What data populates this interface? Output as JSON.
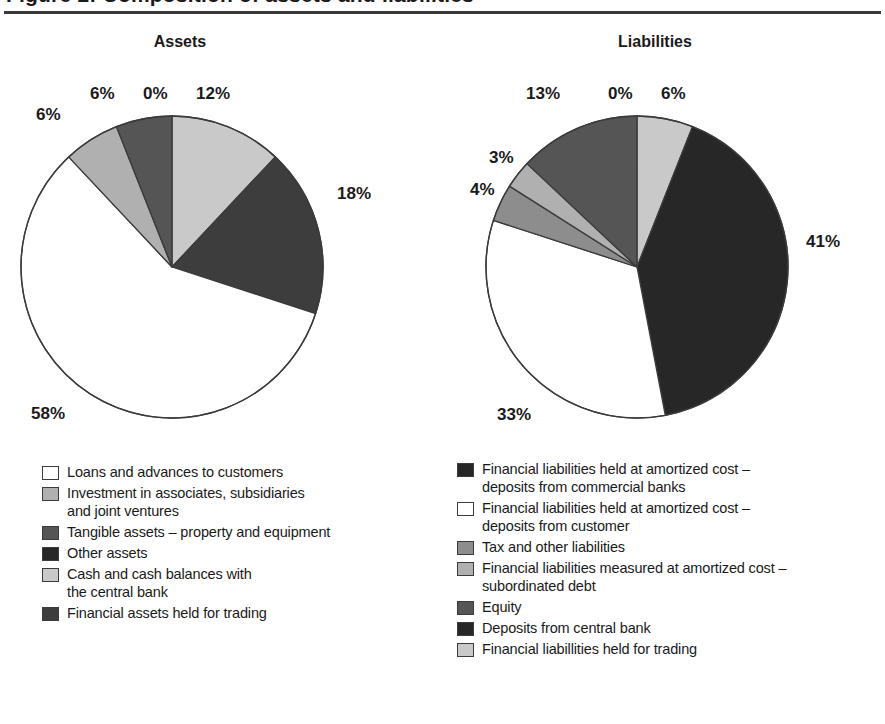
{
  "document": {
    "title_partial": "Figure 2: Composition of assets and liabilities",
    "heading_assets": "Assets",
    "heading_liabilities": "Liabilities"
  },
  "palette": {
    "white": "#ffffff",
    "light_gray": "#c9c9c9",
    "mid_light_gray": "#b0b0b0",
    "mid_gray": "#8d8d8d",
    "dark_gray": "#555555",
    "darker_gray": "#3d3d3d",
    "near_black": "#272727",
    "outline": "#3b3b3b",
    "text": "#1a1a1a",
    "rule": "#3a3a3a"
  },
  "chart_data": [
    {
      "type": "pie",
      "title": "Assets",
      "start_angle_deg": 0,
      "direction": "clockwise",
      "value_suffix": "%",
      "categories": [
        "Other assets",
        "Cash and cash balances with the central bank",
        "Financial assets held for trading",
        "Loans and advances to customers",
        "Investment in associates, subsidiaries and joint ventures",
        "Tangible assets – property and equipment"
      ],
      "values": [
        0,
        12,
        18,
        58,
        6,
        6
      ],
      "labels": [
        "0%",
        "12%",
        "18%",
        "58%",
        "6%",
        "6%"
      ],
      "colors": [
        "#272727",
        "#c9c9c9",
        "#3d3d3d",
        "#ffffff",
        "#b0b0b0",
        "#555555"
      ]
    },
    {
      "type": "pie",
      "title": "Liabilities",
      "start_angle_deg": 0,
      "direction": "clockwise",
      "value_suffix": "%",
      "categories": [
        "Deposits from central bank",
        "Financial liabillities held for trading",
        "Financial liabilities held at amortized cost – deposits from commercial banks",
        "Financial liabilities held at amortized cost – deposits from customer",
        "Tax and other liabilities",
        "Financial liabilities measured at amortized cost – subordinated debt",
        "Equity"
      ],
      "values": [
        0,
        6,
        41,
        33,
        4,
        3,
        13
      ],
      "labels": [
        "0%",
        "6%",
        "41%",
        "33%",
        "4%",
        "3%",
        "13%"
      ],
      "colors": [
        "#272727",
        "#c9c9c9",
        "#272727",
        "#ffffff",
        "#8d8d8d",
        "#b0b0b0",
        "#555555"
      ]
    }
  ],
  "callouts": {
    "assets": [
      {
        "key": "a0",
        "text": "6%"
      },
      {
        "key": "a1",
        "text": "6%"
      },
      {
        "key": "a2",
        "text": "0%"
      },
      {
        "key": "a3",
        "text": "12%"
      },
      {
        "key": "a4",
        "text": "18%"
      },
      {
        "key": "a5",
        "text": "58%"
      }
    ],
    "liabilities": [
      {
        "key": "l0",
        "text": "13%"
      },
      {
        "key": "l1",
        "text": "0%"
      },
      {
        "key": "l2",
        "text": "6%"
      },
      {
        "key": "l3",
        "text": "3%"
      },
      {
        "key": "l4",
        "text": "4%"
      },
      {
        "key": "l5",
        "text": "41%"
      },
      {
        "key": "l6",
        "text": "33%"
      }
    ]
  },
  "legend_assets": {
    "items": [
      {
        "color": "#ffffff",
        "line1": "Loans and advances to customers",
        "line2": ""
      },
      {
        "color": "#b0b0b0",
        "line1": "Investment in associates, subsidiaries",
        "line2": "and joint ventures"
      },
      {
        "color": "#555555",
        "line1": "Tangible assets – property and equipment",
        "line2": ""
      },
      {
        "color": "#272727",
        "line1": "Other assets",
        "line2": ""
      },
      {
        "color": "#c9c9c9",
        "line1": "Cash and cash balances with",
        "line2": "the central bank"
      },
      {
        "color": "#3d3d3d",
        "line1": "Financial assets held for trading",
        "line2": ""
      }
    ]
  },
  "legend_liabilities": {
    "items": [
      {
        "color": "#272727",
        "line1": "Financial liabilities held at amortized cost –",
        "line2": "deposits from commercial banks"
      },
      {
        "color": "#ffffff",
        "line1": "Financial liabilities held at amortized cost –",
        "line2": "deposits from customer"
      },
      {
        "color": "#8d8d8d",
        "line1": "Tax and other liabilities",
        "line2": ""
      },
      {
        "color": "#b0b0b0",
        "line1": "Financial liabilities measured at amortized cost –",
        "line2": "subordinated debt"
      },
      {
        "color": "#555555",
        "line1": "Equity",
        "line2": ""
      },
      {
        "color": "#272727",
        "line1": "Deposits from central bank",
        "line2": ""
      },
      {
        "color": "#c9c9c9",
        "line1": "Financial liabillities held for trading",
        "line2": ""
      }
    ]
  }
}
